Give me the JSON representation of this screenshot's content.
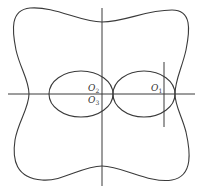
{
  "diagram": {
    "labels": {
      "o2": {
        "base": "O",
        "sub": "2"
      },
      "o3": {
        "base": "O",
        "sub": "3"
      },
      "o1": {
        "base": "O",
        "sub": "1"
      }
    },
    "colors": {
      "stroke": "#3a3a3a",
      "background": "#ffffff"
    }
  }
}
